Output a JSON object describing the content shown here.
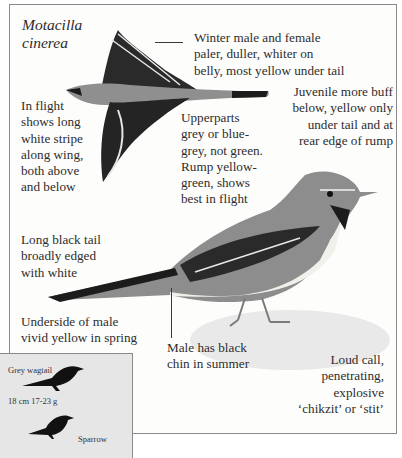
{
  "species": {
    "scientific_name_line1": "Motacilla",
    "scientific_name_line2": "cinerea"
  },
  "annotations": {
    "winter": [
      "Winter male and female",
      "paler, duller, whiter on",
      "belly, most yellow under tail"
    ],
    "juvenile": [
      "Juvenile more buff",
      "below, yellow only",
      "under tail and at",
      "rear edge of rump"
    ],
    "in_flight": [
      "In flight",
      "shows long",
      "white stripe",
      "along wing,",
      "both above",
      "and below"
    ],
    "upperparts": [
      "Upperparts",
      "grey or blue-",
      "grey, not green.",
      "Rump yellow-",
      "green, shows",
      "best in flight"
    ],
    "tail": [
      "Long black tail",
      "broadly edged",
      "with white"
    ],
    "underside": [
      "Underside of male",
      "vivid yellow in spring"
    ],
    "chin": [
      "Male has black",
      "chin in summer"
    ],
    "call": [
      "Loud call,",
      "penetrating,",
      "explosive",
      "‘chikzit’ or ‘stit’"
    ]
  },
  "size_comparison": {
    "bird1_label": "Grey wagtail",
    "bird1_size": "18 cm  17-23 g",
    "bird2_label": "Sparrow"
  },
  "colors": {
    "frame_border": "#8a8a8a",
    "inset_bg": "#e6e6e6",
    "text": "#2d2d2d"
  }
}
